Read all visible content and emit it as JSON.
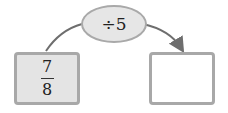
{
  "operation": {
    "label": "÷5"
  },
  "input": {
    "numerator": "7",
    "denominator": "8"
  },
  "output": {
    "value": ""
  },
  "colors": {
    "box_border": "#a8a8a8",
    "input_fill": "#e4e4e4",
    "oval_fill": "#e6e6e6",
    "arrow": "#6e6e6e"
  }
}
